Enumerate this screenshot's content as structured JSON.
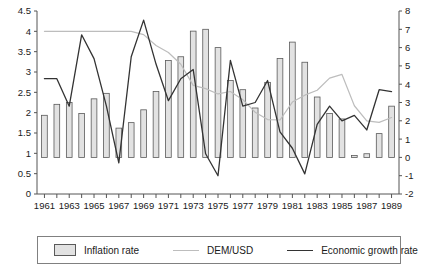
{
  "chart_data": {
    "type": "bar",
    "title": "",
    "subtitle": "",
    "xlabel": "",
    "ylabel": "",
    "grid": false,
    "legend_position": "bottom",
    "x": [
      1961,
      1962,
      1963,
      1964,
      1965,
      1966,
      1967,
      1968,
      1969,
      1970,
      1971,
      1972,
      1973,
      1974,
      1975,
      1976,
      1977,
      1978,
      1979,
      1980,
      1981,
      1982,
      1983,
      1984,
      1985,
      1986,
      1987,
      1988,
      1989
    ],
    "x_tick_labels": [
      "1961",
      "1963",
      "1965",
      "1967",
      "1969",
      "1971",
      "1973",
      "1975",
      "1977",
      "1979",
      "1981",
      "1983",
      "1985",
      "1987",
      "1989"
    ],
    "x_tick_values": [
      1961,
      1963,
      1965,
      1967,
      1969,
      1971,
      1973,
      1975,
      1977,
      1979,
      1981,
      1983,
      1985,
      1987,
      1989
    ],
    "xlim": [
      1960.4,
      1989.6
    ],
    "left_axis": {
      "label": "",
      "ylim": [
        0,
        4.5
      ],
      "ticks": [
        0,
        0.5,
        1,
        1.5,
        2,
        2.5,
        3,
        3.5,
        4,
        4.5
      ],
      "tick_labels": [
        "0",
        "0.5",
        "1",
        "1.5",
        "2",
        "2.5",
        "3",
        "3.5",
        "4",
        "4.5"
      ]
    },
    "right_axis": {
      "label": "",
      "ylim": [
        -2,
        8
      ],
      "ticks": [
        -2,
        -1,
        0,
        1,
        2,
        3,
        4,
        5,
        6,
        7,
        8
      ],
      "tick_labels": [
        "-2",
        "-1",
        "0",
        "1",
        "2",
        "3",
        "4",
        "5",
        "6",
        "7",
        "8"
      ]
    },
    "series": [
      {
        "name": "Inflation rate",
        "type": "bar",
        "axis": "right",
        "color": "#e2e2e2",
        "edge_color": "#5a5a5a",
        "values": [
          2.3,
          2.9,
          3.0,
          2.4,
          3.2,
          3.5,
          1.6,
          1.9,
          2.6,
          3.6,
          5.3,
          5.5,
          6.9,
          7.0,
          6.0,
          4.2,
          3.7,
          2.7,
          4.1,
          5.4,
          6.3,
          5.2,
          3.3,
          2.4,
          2.1,
          0.1,
          0.2,
          1.3,
          2.8
        ]
      },
      {
        "name": "DEM/USD",
        "type": "line",
        "axis": "left",
        "color": "#bdbdbd",
        "values": [
          4.0,
          4.0,
          4.0,
          4.0,
          4.0,
          4.0,
          4.0,
          4.0,
          3.92,
          3.65,
          3.48,
          3.19,
          2.67,
          2.59,
          2.46,
          2.52,
          2.32,
          2.01,
          1.83,
          1.82,
          2.26,
          2.43,
          2.55,
          2.85,
          2.94,
          2.17,
          1.8,
          1.76,
          1.88
        ]
      },
      {
        "name": "Economic growth rate",
        "type": "line",
        "axis": "right",
        "color": "#333333",
        "values": [
          4.3,
          4.3,
          2.8,
          6.7,
          5.4,
          2.8,
          -0.3,
          5.5,
          7.5,
          5.1,
          3.1,
          4.3,
          4.8,
          0.2,
          -1.0,
          5.3,
          2.8,
          3.0,
          4.2,
          1.4,
          0.5,
          -0.9,
          1.8,
          2.8,
          2.0,
          2.3,
          1.5,
          3.7,
          3.6
        ]
      }
    ]
  },
  "legend": {
    "items": [
      {
        "label": "Inflation rate",
        "marker": "bar-swatch"
      },
      {
        "label": "DEM/USD",
        "marker": "line-swatch-light"
      },
      {
        "label": "Economic growth rate",
        "marker": "line-swatch-dark"
      }
    ]
  }
}
